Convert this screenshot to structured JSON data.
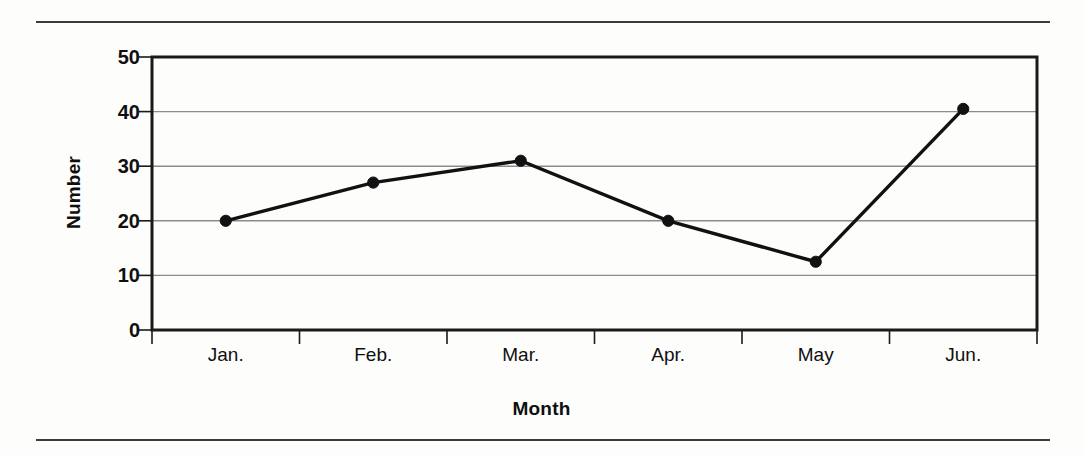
{
  "chart_data": {
    "type": "line",
    "title": "",
    "xlabel": "Month",
    "ylabel": "Number",
    "categories": [
      "Jan.",
      "Feb.",
      "Mar.",
      "Apr.",
      "May",
      "Jun."
    ],
    "values": [
      20,
      27,
      31,
      20,
      12.5,
      40.5
    ],
    "series": [
      {
        "name": "Number",
        "values": [
          20,
          27,
          31,
          20,
          12.5,
          40.5
        ]
      }
    ],
    "ylim": [
      0,
      50
    ],
    "yticks": [
      0,
      10,
      20,
      30,
      40,
      50
    ],
    "ytick_labels": [
      "0",
      "10",
      "20",
      "30",
      "40",
      "50"
    ],
    "grid": true,
    "grid_axis": "y",
    "legend": false,
    "legend_position": "none",
    "marker": "filled-circle",
    "line_color": "#111111",
    "marker_color": "#111111",
    "grid_color": "#8c8c8c",
    "axis_color": "#1a1a1a",
    "background_color": "#fdfdfc"
  },
  "figure": {
    "top_rule": "horizontal-rule",
    "bottom_rule": "horizontal-rule"
  }
}
